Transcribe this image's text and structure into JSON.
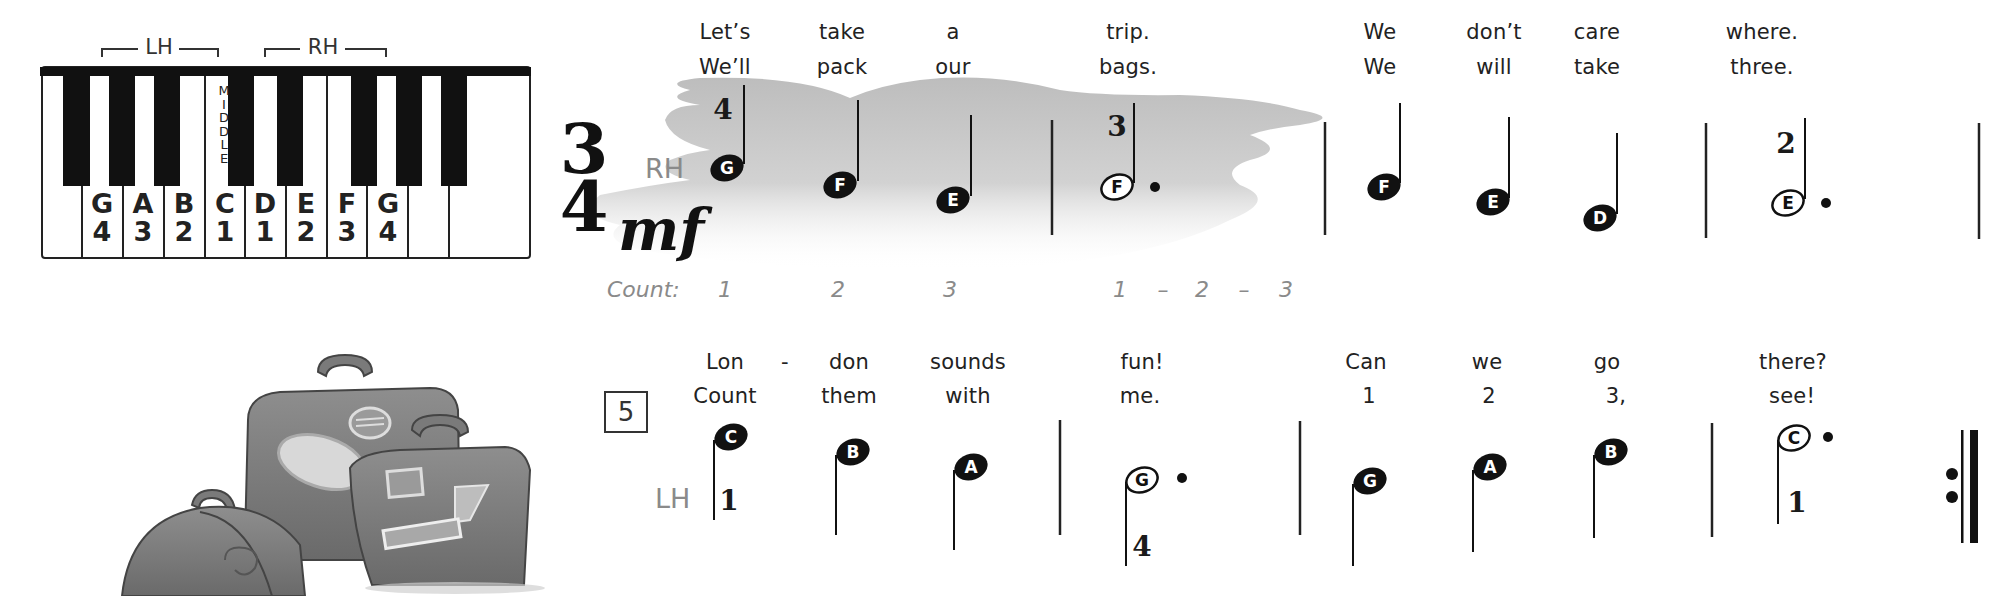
{
  "keyboard": {
    "hand_labels": {
      "lh": "LH",
      "rh": "RH"
    },
    "white_key_count": 11,
    "middle_label": [
      "M",
      "I",
      "D",
      "D",
      "L",
      "E"
    ],
    "keys": [
      {
        "note": "G",
        "finger": "4"
      },
      {
        "note": "A",
        "finger": "3"
      },
      {
        "note": "B",
        "finger": "2"
      },
      {
        "note": "C",
        "finger": "1"
      },
      {
        "note": "D",
        "finger": "1"
      },
      {
        "note": "E",
        "finger": "2"
      },
      {
        "note": "F",
        "finger": "3"
      },
      {
        "note": "G",
        "finger": "4"
      }
    ]
  },
  "illustration": {
    "name": "luggage-suitcases"
  },
  "system1": {
    "time_signature": {
      "top": "3",
      "bottom": "4"
    },
    "dynamic": "mf",
    "hand": "RH",
    "count_label": "Count:",
    "counts": [
      "1",
      "2",
      "3",
      "1",
      "–",
      "2",
      "–",
      "3"
    ],
    "lyrics_verse1": [
      "Let’s",
      "take",
      "a",
      "trip.",
      "We",
      "don’t",
      "care",
      "where."
    ],
    "lyrics_verse2": [
      "We’ll",
      "pack",
      "our",
      "bags.",
      "We",
      "will",
      "take",
      "three."
    ],
    "notes": [
      {
        "name": "G",
        "type": "quarter",
        "finger": "4"
      },
      {
        "name": "F",
        "type": "quarter"
      },
      {
        "name": "E",
        "type": "quarter"
      },
      {
        "name": "F",
        "type": "dotted-half",
        "finger": "3"
      },
      {
        "name": "F",
        "type": "quarter"
      },
      {
        "name": "E",
        "type": "quarter"
      },
      {
        "name": "D",
        "type": "quarter"
      },
      {
        "name": "E",
        "type": "dotted-half",
        "finger": "2"
      }
    ]
  },
  "system2": {
    "measure_number": "5",
    "hand": "LH",
    "lyrics_verse1": [
      "Lon",
      "-",
      "don",
      "sounds",
      "fun!",
      "Can",
      "we",
      "go",
      "there?"
    ],
    "lyrics_verse2": [
      "Count",
      "them",
      "with",
      "me.",
      "1",
      "2",
      "3,",
      "see!"
    ],
    "notes": [
      {
        "name": "C",
        "type": "quarter",
        "finger": "1"
      },
      {
        "name": "B",
        "type": "quarter"
      },
      {
        "name": "A",
        "type": "quarter"
      },
      {
        "name": "G",
        "type": "dotted-half",
        "finger": "4"
      },
      {
        "name": "G",
        "type": "quarter"
      },
      {
        "name": "A",
        "type": "quarter"
      },
      {
        "name": "B",
        "type": "quarter"
      },
      {
        "name": "C",
        "type": "dotted-half",
        "finger": "1"
      }
    ],
    "end_sign": "repeat"
  },
  "colors": {
    "ink": "#111111",
    "cloud": "#c4c4c4",
    "muted_text": "#8a8a8a"
  }
}
